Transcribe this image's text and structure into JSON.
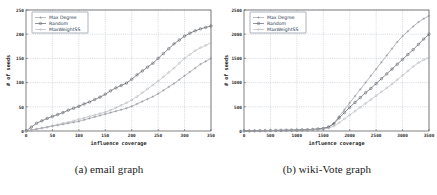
{
  "figure": {
    "panels": [
      {
        "id": "panel-a",
        "caption": "(a) email graph",
        "chart_index": 0
      },
      {
        "id": "panel-b",
        "caption": "(b) wiki-Vote graph",
        "chart_index": 1
      }
    ]
  },
  "chart_data": [
    {
      "type": "line",
      "title": "",
      "xlabel": "influence coverage",
      "ylabel": "# of seeds",
      "xlim": [
        0,
        350
      ],
      "ylim": [
        0,
        250
      ],
      "xticks": [
        0,
        50,
        100,
        150,
        200,
        250,
        300,
        350
      ],
      "yticks": [
        0,
        50,
        100,
        150,
        200,
        250
      ],
      "grid": true,
      "legend_position": "top-left",
      "legend": [
        "Max Degree",
        "Random",
        "MaxWeightSS"
      ],
      "markers": [
        "plus",
        "circle",
        "diamond"
      ],
      "colors": [
        "#8d8f96",
        "#4c4f58",
        "#b0b2b8"
      ],
      "x": [
        0,
        10,
        20,
        30,
        40,
        50,
        60,
        70,
        80,
        90,
        100,
        110,
        120,
        130,
        140,
        150,
        160,
        170,
        180,
        190,
        200,
        210,
        220,
        230,
        240,
        250,
        260,
        270,
        280,
        290,
        300,
        310,
        320,
        330,
        340,
        350
      ],
      "series": [
        {
          "name": "Max Degree",
          "values": [
            0,
            2,
            4,
            6,
            8,
            10,
            12,
            14,
            16,
            18,
            20,
            23,
            26,
            29,
            32,
            35,
            38,
            41,
            44,
            47,
            51,
            56,
            61,
            66,
            71,
            77,
            84,
            91,
            98,
            106,
            114,
            122,
            130,
            138,
            144,
            150
          ]
        },
        {
          "name": "Random",
          "values": [
            0,
            8,
            16,
            21,
            26,
            30,
            34,
            38,
            43,
            47,
            51,
            56,
            60,
            65,
            70,
            76,
            83,
            89,
            94,
            99,
            107,
            116,
            124,
            132,
            140,
            150,
            160,
            170,
            180,
            188,
            196,
            202,
            207,
            211,
            214,
            217
          ]
        },
        {
          "name": "MaxWeightSS",
          "values": [
            0,
            2,
            4,
            6,
            8,
            11,
            13,
            16,
            18,
            21,
            24,
            27,
            30,
            33,
            36,
            39,
            43,
            48,
            53,
            58,
            64,
            71,
            79,
            87,
            95,
            103,
            112,
            121,
            130,
            140,
            150,
            158,
            166,
            172,
            177,
            182
          ]
        }
      ]
    },
    {
      "type": "line",
      "title": "",
      "xlabel": "influence coverage",
      "ylabel": "# of seeds",
      "xlim": [
        0,
        3500
      ],
      "ylim": [
        0,
        2500
      ],
      "xticks": [
        0,
        500,
        1000,
        1500,
        2000,
        2500,
        3000,
        3500
      ],
      "yticks": [
        0,
        500,
        1000,
        1500,
        2000,
        2500
      ],
      "grid": true,
      "legend_position": "top-left",
      "legend": [
        "Max Degree",
        "Random",
        "MaxWeightSS"
      ],
      "markers": [
        "plus",
        "circle",
        "diamond"
      ],
      "colors": [
        "#8d8f96",
        "#4c4f58",
        "#b0b2b8"
      ],
      "x": [
        0,
        100,
        200,
        300,
        400,
        500,
        600,
        700,
        800,
        900,
        1000,
        1100,
        1200,
        1300,
        1400,
        1500,
        1600,
        1700,
        1800,
        1900,
        2000,
        2100,
        2200,
        2300,
        2400,
        2500,
        2600,
        2700,
        2800,
        2900,
        3000,
        3100,
        3200,
        3300,
        3400,
        3500
      ],
      "series": [
        {
          "name": "Max Degree",
          "values": [
            0,
            2,
            4,
            6,
            8,
            10,
            12,
            14,
            16,
            18,
            20,
            24,
            28,
            34,
            42,
            55,
            85,
            160,
            300,
            440,
            580,
            720,
            860,
            1000,
            1140,
            1280,
            1420,
            1560,
            1700,
            1840,
            1960,
            2060,
            2160,
            2250,
            2320,
            2380
          ]
        },
        {
          "name": "Random",
          "values": [
            0,
            2,
            4,
            6,
            8,
            10,
            12,
            14,
            16,
            18,
            20,
            23,
            27,
            32,
            40,
            52,
            80,
            150,
            270,
            380,
            490,
            590,
            690,
            790,
            880,
            980,
            1080,
            1180,
            1280,
            1380,
            1480,
            1580,
            1680,
            1790,
            1900,
            2000
          ]
        },
        {
          "name": "MaxWeightSS",
          "values": [
            0,
            2,
            4,
            6,
            8,
            10,
            12,
            14,
            16,
            18,
            20,
            22,
            25,
            29,
            34,
            42,
            60,
            100,
            170,
            250,
            330,
            410,
            490,
            570,
            650,
            730,
            810,
            890,
            970,
            1060,
            1150,
            1240,
            1330,
            1410,
            1470,
            1520
          ]
        }
      ]
    }
  ]
}
